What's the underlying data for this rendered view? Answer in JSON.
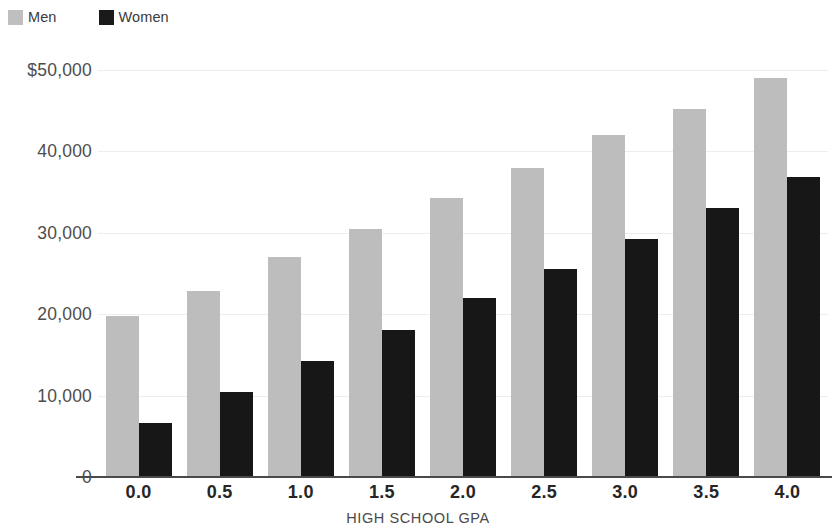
{
  "legend": {
    "position": "top-left",
    "entries": [
      {
        "label": "Men",
        "color": "#bdbdbd",
        "swatch": "men-swatch-icon"
      },
      {
        "label": "Women",
        "color": "#171717",
        "swatch": "women-swatch-icon"
      }
    ]
  },
  "axes": {
    "y_ticks": [
      "$50,000",
      "40,000",
      "30,000",
      "20,000",
      "10,000",
      "0"
    ],
    "y_tick_values": [
      50000,
      40000,
      30000,
      20000,
      10000,
      0
    ],
    "x_title": "HIGH SCHOOL GPA"
  },
  "chart_data": {
    "type": "bar",
    "title": "",
    "subtitle": "",
    "xlabel": "HIGH SCHOOL GPA",
    "ylabel": "",
    "categories": [
      "0.0",
      "0.5",
      "1.0",
      "1.5",
      "2.0",
      "2.5",
      "3.0",
      "3.5",
      "4.0"
    ],
    "series": [
      {
        "name": "Men",
        "color": "#bdbdbd",
        "values": [
          19800,
          22800,
          27000,
          30500,
          34300,
          38000,
          42000,
          45200,
          49000
        ]
      },
      {
        "name": "Women",
        "color": "#171717",
        "values": [
          6600,
          10400,
          14200,
          18100,
          22000,
          25600,
          29200,
          33000,
          36800
        ]
      }
    ],
    "ylim": [
      0,
      50000
    ],
    "ytick_step": 10000,
    "ytick_labels": [
      "$50,000",
      "40,000",
      "30,000",
      "20,000",
      "10,000",
      "0"
    ],
    "grid": true,
    "grid_axis": "y",
    "legend_position": "top-left",
    "bar_group_gap": true,
    "currency_prefix": "$"
  }
}
